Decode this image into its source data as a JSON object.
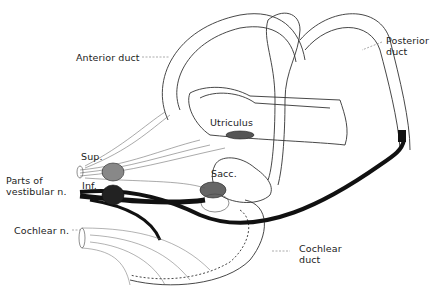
{
  "diagram": {
    "labels": {
      "anterior_duct": "Anterior duct",
      "posterior_duct_1": "Posterior",
      "posterior_duct_2": "duct",
      "utriculus": "Utriculus",
      "sacc": "Sacc.",
      "sup": "Sup.",
      "inf": "Inf.",
      "parts_of_1": "Parts of",
      "parts_of_2": "vestibular n.",
      "cochlear_n": "Cochlear n.",
      "cochlear_duct_1": "Cochlear",
      "cochlear_duct_2": "duct"
    },
    "colors": {
      "line": "#333333",
      "nerve_dark": "#111111",
      "background": "#ffffff"
    }
  }
}
